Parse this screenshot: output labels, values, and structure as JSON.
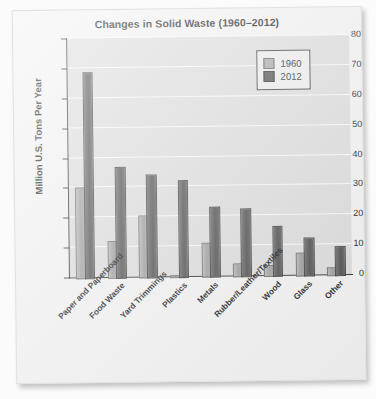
{
  "chart_data": {
    "type": "bar",
    "title": "Changes in Solid Waste (1960–2012)",
    "xlabel": "",
    "ylabel": "Million U.S. Tons Per Year",
    "ylim": [
      0,
      80
    ],
    "ytick_step": 10,
    "yticks": [
      0,
      10,
      20,
      30,
      40,
      50,
      60,
      70,
      80
    ],
    "grid": true,
    "grid_color": "#fafafa",
    "plot_background": "#dcdcdc",
    "legend_position": "top-right",
    "categories": [
      "Paper and Paperboard",
      "Food Waste",
      "Yard Trimmings",
      "Plastics",
      "Metals",
      "Rubber/Leather/Textiles",
      "Wood",
      "Glass",
      "Other"
    ],
    "series": [
      {
        "name": "1960",
        "color": "#a8a8a8",
        "values": [
          30.0,
          12.2,
          20.3,
          0.4,
          11.0,
          4.0,
          3.5,
          7.5,
          2.2
        ]
      },
      {
        "name": "2012",
        "color": "#4e4e4e",
        "values": [
          68.5,
          36.8,
          34.2,
          32.0,
          23.0,
          22.3,
          16.3,
          12.5,
          9.4
        ]
      }
    ]
  }
}
